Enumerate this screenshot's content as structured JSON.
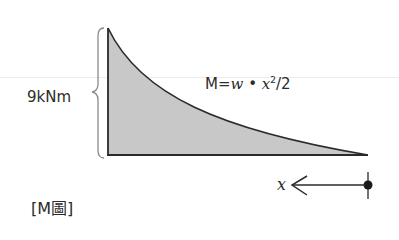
{
  "diagram": {
    "type": "bending-moment-diagram",
    "magnitude_label": "9kNm",
    "formula": {
      "lhs": "M=",
      "var1": "w",
      "dot": " • ",
      "var2": "x",
      "exponent": "2",
      "tail": "/2"
    },
    "axis_variable": "x",
    "caption": "[M圖]",
    "colors": {
      "fill": "#c8c8c8",
      "stroke": "#2a2a2a",
      "text": "#2b2b2b",
      "brace": "#8a8a8a"
    },
    "shape": {
      "left_x": 108,
      "top_y": 28,
      "baseline_y": 155,
      "right_x": 368
    }
  }
}
